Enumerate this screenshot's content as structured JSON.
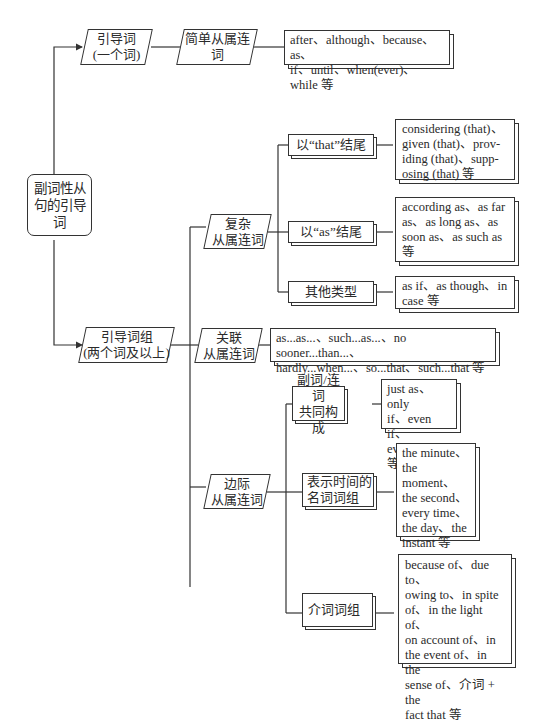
{
  "root": {
    "label": "副词性从句的引导词"
  },
  "branches": [
    {
      "label": "引导词\n(一个词)",
      "line1": "引导词",
      "line2": "(一个词)",
      "children": [
        {
          "label": "简单从属连词",
          "examples": "after、although、because、as、if、until、when(ever)、while 等",
          "ex_line1": "after、although、because、as、",
          "ex_line2": "if、until、when(ever)、while 等"
        }
      ]
    },
    {
      "line1": "引导词组",
      "line2": "(两个词及以上)",
      "children": [
        {
          "line1": "复杂",
          "line2": "从属连词",
          "subtypes": [
            {
              "label": "以“that”结尾",
              "examples": [
                "considering (that)、",
                "given (that)、prov-",
                "iding (that)、supp-",
                "osing (that) 等"
              ]
            },
            {
              "label": "以“as”结尾",
              "examples": [
                "according as、as far",
                "as、as long as、as",
                "soon as、as such as",
                "等"
              ]
            },
            {
              "label": "其他类型",
              "examples": [
                "as if、as though、in",
                "case 等"
              ]
            }
          ]
        },
        {
          "line1": "关联",
          "line2": "从属连词",
          "examples": [
            "as...as...、such...as...、no sooner...than...、",
            "hardly...when...、so...that、such...that 等"
          ]
        },
        {
          "line1": "边际",
          "line2": "从属连词",
          "subtypes": [
            {
              "line1": "副词/连词",
              "line2": "共同构成",
              "examples": [
                "just as、only",
                "if、even if、",
                "even when 等"
              ]
            },
            {
              "line1": "表示时间的",
              "line2": "名词词组",
              "examples": [
                "the minute、",
                "the moment、",
                "the second、",
                "every time、",
                "the day、the",
                "instant 等"
              ]
            },
            {
              "label": "介词词组",
              "examples": [
                "because of、due to、",
                "owing to、in spite",
                "of、in the light of、",
                "on account of、in",
                "the event of、in the",
                "sense of、介词 + the",
                "fact that 等"
              ]
            }
          ]
        }
      ]
    }
  ],
  "colors": {
    "line": "#333333",
    "background": "#ffffff",
    "text": "#2a2a2a"
  }
}
